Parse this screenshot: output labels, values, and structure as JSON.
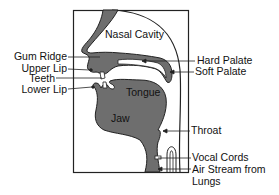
{
  "colors": {
    "tissue": "#6e6e6e",
    "outline": "#222222",
    "background": "#ffffff",
    "text": "#111111"
  },
  "regions": {
    "nasal_cavity": "Nasal Cavity",
    "tongue": "Tongue",
    "jaw": "Jaw"
  },
  "labels_left": [
    {
      "id": "gum-ridge",
      "text": "Gum Ridge"
    },
    {
      "id": "upper-lip",
      "text": "Upper Lip"
    },
    {
      "id": "teeth",
      "text": "Teeth"
    },
    {
      "id": "lower-lip",
      "text": "Lower Lip"
    }
  ],
  "labels_right": [
    {
      "id": "hard-palate",
      "text": "Hard Palate"
    },
    {
      "id": "soft-palate",
      "text": "Soft Palate"
    },
    {
      "id": "throat",
      "text": "Throat"
    },
    {
      "id": "vocal-cords",
      "text": "Vocal Cords"
    },
    {
      "id": "air-stream",
      "text": "Air Stream from",
      "text2": "Lungs"
    }
  ]
}
